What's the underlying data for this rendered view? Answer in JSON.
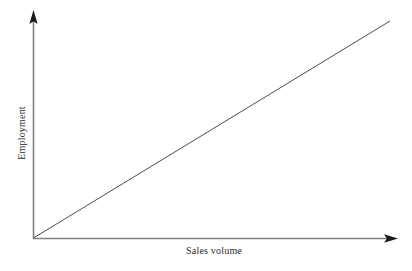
{
  "chart_data": {
    "type": "line",
    "title": "",
    "subtitle": "",
    "xlabel": "Sales volume",
    "ylabel": "Employment",
    "grid": false,
    "legend": null,
    "legend_position": "none",
    "xlim": [
      0,
      1
    ],
    "ylim": [
      0,
      1
    ],
    "xticks": [],
    "yticks": [],
    "xticklabels": [],
    "yticklabels": [],
    "annotations": [],
    "series": [
      {
        "name": "Employment vs sales volume",
        "kind": "line",
        "x": [
          0,
          0.25,
          0.5,
          0.75,
          1
        ],
        "y": [
          0,
          0.25,
          0.5,
          0.75,
          1
        ],
        "color": "#4d4d4d",
        "linewidth": 1,
        "description": "Straight positively-sloped line rising from the origin"
      }
    ],
    "axis_style": {
      "arrows": true,
      "x_axis_color": "#808080",
      "y_axis_color": "#808080",
      "arrow_color": "#1a1a1a"
    }
  },
  "labels": {
    "x_axis": "Sales volume",
    "y_axis": "Employment"
  },
  "colors": {
    "background": "#ffffff",
    "axis": "#808080",
    "arrow": "#1a1a1a",
    "line": "#4d4d4d",
    "text": "#2b2b2b"
  }
}
